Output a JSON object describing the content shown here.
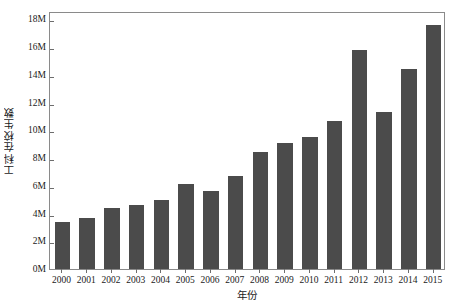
{
  "chart_data": {
    "type": "bar",
    "title": "",
    "xlabel": "年份",
    "ylabel": "工科在校生数",
    "categories": [
      "2000",
      "2001",
      "2002",
      "2003",
      "2004",
      "2005",
      "2006",
      "2007",
      "2008",
      "2009",
      "2010",
      "2011",
      "2012",
      "2013",
      "2014",
      "2015"
    ],
    "values": [
      3400000,
      3700000,
      4400000,
      4600000,
      5000000,
      6100000,
      5600000,
      6700000,
      8400000,
      9100000,
      9500000,
      10700000,
      15800000,
      11300000,
      14400000,
      17600000
    ],
    "ylim": [
      0,
      18600000
    ],
    "yticks": [
      0,
      2000000,
      4000000,
      6000000,
      8000000,
      10000000,
      12000000,
      14000000,
      16000000,
      18000000
    ],
    "ytick_labels": [
      "0M",
      "2M",
      "4M",
      "6M",
      "8M",
      "10M",
      "12M",
      "14M",
      "16M",
      "18M"
    ],
    "grid": false,
    "legend": null,
    "bar_color": "#4b4b4b",
    "axis_color": "#8a8a8a",
    "background_color": "#ffffff"
  }
}
